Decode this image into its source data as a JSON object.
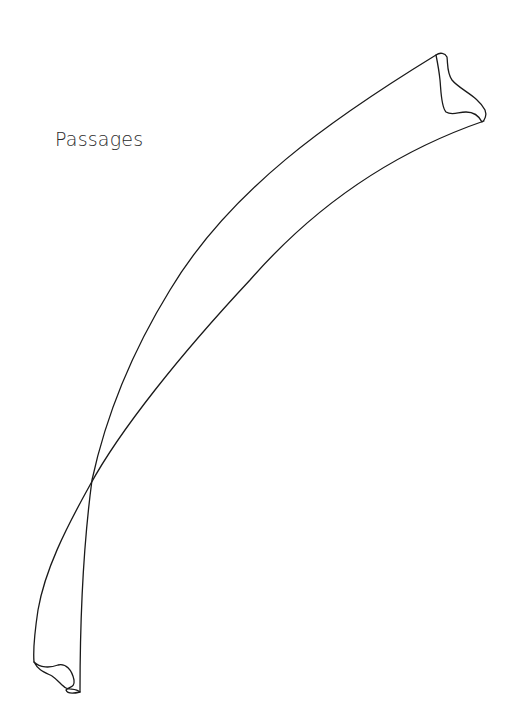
{
  "page": {
    "title": "Passages"
  },
  "drawing": {
    "subject": "twisted ribbon line drawing",
    "stroke_color": "#1a1a1a",
    "background": "#ffffff"
  }
}
